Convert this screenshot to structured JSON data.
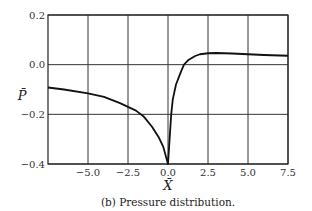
{
  "chart_data": {
    "type": "line",
    "title": "",
    "caption": "(b) Pressure distribution.",
    "xlabel": "X̄",
    "ylabel": "P̄",
    "xlim": [
      -7.5,
      7.5
    ],
    "ylim": [
      -0.4,
      0.2
    ],
    "xticks": [
      -5.0,
      -2.5,
      0.0,
      2.5,
      5.0,
      7.5
    ],
    "xtick_labels": [
      "−5.0",
      "−2.5",
      "0.0",
      "2.5",
      "5.0",
      "7.5"
    ],
    "yticks": [
      0.2,
      0.0,
      -0.2,
      -0.4
    ],
    "ytick_labels": [
      "0.2",
      "0.0",
      "−0.2",
      "−0.4"
    ],
    "grid": true,
    "legend": null,
    "series": [
      {
        "name": "pressure",
        "color": "#111111",
        "x": [
          -7.5,
          -6.5,
          -5.0,
          -4.0,
          -3.0,
          -2.5,
          -2.0,
          -1.5,
          -1.0,
          -0.6,
          -0.3,
          0.0,
          0.05,
          0.1,
          0.2,
          0.3,
          0.5,
          0.8,
          1.0,
          1.3,
          1.7,
          2.0,
          2.5,
          3.0,
          4.0,
          5.0,
          6.0,
          7.5
        ],
        "y": [
          -0.092,
          -0.1,
          -0.116,
          -0.13,
          -0.155,
          -0.17,
          -0.185,
          -0.21,
          -0.25,
          -0.29,
          -0.33,
          -0.4,
          -0.35,
          -0.3,
          -0.2,
          -0.14,
          -0.08,
          -0.03,
          0.0,
          0.02,
          0.035,
          0.042,
          0.046,
          0.047,
          0.045,
          0.042,
          0.039,
          0.036
        ]
      }
    ]
  }
}
